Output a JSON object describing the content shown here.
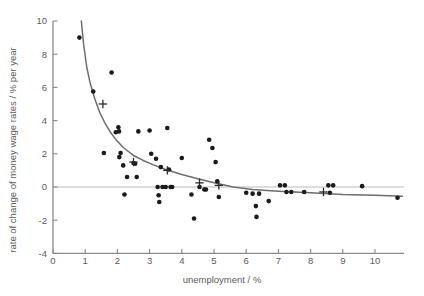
{
  "chart_data": {
    "type": "scatter",
    "title": "",
    "xlabel": "unemployment / %",
    "ylabel": "rate of change of money wage rates / % per year",
    "xlim": [
      0,
      10.9
    ],
    "ylim": [
      -4,
      10
    ],
    "xticks": [
      0,
      1,
      2,
      3,
      4,
      5,
      6,
      7,
      8,
      9,
      10
    ],
    "yticks": [
      -4,
      -2,
      0,
      2,
      4,
      6,
      8,
      10
    ],
    "xticklabels": [
      "0",
      "1",
      "2",
      "3",
      "4",
      "5",
      "6",
      "7",
      "8",
      "9",
      "10"
    ],
    "yticklabels": [
      "-4",
      "-2",
      "0",
      "2",
      "4",
      "6",
      "8",
      "10"
    ],
    "grid": false,
    "zero_line": true,
    "legend": "none",
    "colors": {
      "point": "#1a1a1a",
      "curve": "#6d6d6d",
      "axis": "#8a8a8a",
      "zero_line": "#bcbcbc",
      "text": "#5b5b5b",
      "background": "#ffffff"
    },
    "series": [
      {
        "name": "observations",
        "marker": "filled-circle",
        "points": [
          [
            0.82,
            9.0
          ],
          [
            1.25,
            5.75
          ],
          [
            1.58,
            2.05
          ],
          [
            1.82,
            6.9
          ],
          [
            1.95,
            3.3
          ],
          [
            2.03,
            3.6
          ],
          [
            2.05,
            3.35
          ],
          [
            2.06,
            1.8
          ],
          [
            2.1,
            2.05
          ],
          [
            2.18,
            1.3
          ],
          [
            2.3,
            0.6
          ],
          [
            2.22,
            -0.45
          ],
          [
            2.5,
            1.45
          ],
          [
            2.55,
            1.4
          ],
          [
            2.6,
            0.6
          ],
          [
            2.65,
            3.35
          ],
          [
            3.0,
            3.4
          ],
          [
            3.05,
            2.0
          ],
          [
            3.2,
            1.7
          ],
          [
            3.25,
            0.0
          ],
          [
            3.28,
            -0.5
          ],
          [
            3.3,
            -0.9
          ],
          [
            3.35,
            1.2
          ],
          [
            3.4,
            0.0
          ],
          [
            3.5,
            0.0
          ],
          [
            3.55,
            3.55
          ],
          [
            3.6,
            1.05
          ],
          [
            3.65,
            0.0
          ],
          [
            3.7,
            0.0
          ],
          [
            4.0,
            1.75
          ],
          [
            4.3,
            -0.45
          ],
          [
            4.38,
            -1.9
          ],
          [
            4.55,
            0.0
          ],
          [
            4.7,
            -0.15
          ],
          [
            4.75,
            -0.15
          ],
          [
            4.85,
            2.85
          ],
          [
            4.95,
            2.35
          ],
          [
            5.05,
            1.5
          ],
          [
            5.1,
            0.35
          ],
          [
            5.15,
            -0.6
          ],
          [
            6.0,
            -0.35
          ],
          [
            6.2,
            -0.4
          ],
          [
            6.3,
            -1.15
          ],
          [
            6.32,
            -1.8
          ],
          [
            6.4,
            -0.4
          ],
          [
            6.7,
            -0.85
          ],
          [
            7.05,
            0.1
          ],
          [
            7.2,
            0.1
          ],
          [
            7.25,
            -0.3
          ],
          [
            7.4,
            -0.3
          ],
          [
            7.8,
            -0.3
          ],
          [
            8.55,
            0.1
          ],
          [
            8.7,
            0.1
          ],
          [
            8.6,
            -0.35
          ],
          [
            9.6,
            0.05
          ],
          [
            10.7,
            -0.65
          ]
        ]
      },
      {
        "name": "group-means",
        "marker": "plus",
        "points": [
          [
            1.55,
            5.0
          ],
          [
            2.5,
            1.5
          ],
          [
            3.55,
            1.0
          ],
          [
            4.55,
            0.25
          ],
          [
            5.15,
            0.1
          ],
          [
            8.4,
            -0.3
          ]
        ]
      }
    ],
    "fitted_curve": {
      "name": "fitted Phillips curve",
      "style": "solid",
      "points": [
        [
          0.88,
          10.0
        ],
        [
          0.95,
          8.6
        ],
        [
          1.05,
          7.2
        ],
        [
          1.15,
          6.3
        ],
        [
          1.3,
          5.3
        ],
        [
          1.45,
          4.5
        ],
        [
          1.6,
          3.9
        ],
        [
          1.8,
          3.25
        ],
        [
          2.0,
          2.75
        ],
        [
          2.2,
          2.35
        ],
        [
          2.5,
          1.9
        ],
        [
          2.8,
          1.6
        ],
        [
          3.1,
          1.35
        ],
        [
          3.5,
          1.05
        ],
        [
          4.0,
          0.75
        ],
        [
          4.5,
          0.5
        ],
        [
          5.0,
          0.25
        ],
        [
          5.6,
          0.0
        ],
        [
          6.2,
          -0.15
        ],
        [
          7.0,
          -0.25
        ],
        [
          8.0,
          -0.35
        ],
        [
          9.0,
          -0.45
        ],
        [
          10.0,
          -0.5
        ],
        [
          10.85,
          -0.55
        ]
      ]
    }
  }
}
